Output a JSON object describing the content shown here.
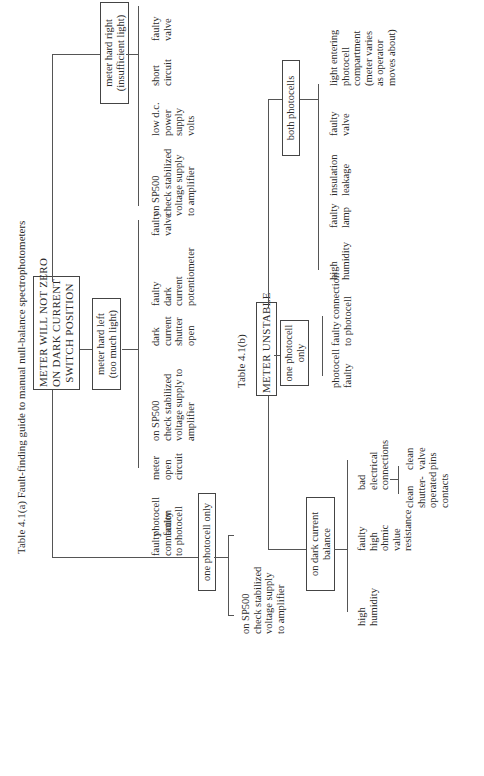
{
  "table_a": {
    "caption": "Table 4.1(a) Fault-finding guide to manual null-balance spectrophotometers",
    "root": "METER WILL NOT ZERO\nON DARK CURRENT\nSWITCH POSITION",
    "branches": [
      {
        "label": "one photocell only",
        "causes": [
          "on SP500\ncheck stabilized\nvoltage supply\nto amplifier",
          "faulty\nconnection\nto photocell",
          "photocell\nfaulty"
        ]
      },
      {
        "label": "meter hard left\n(too much light)",
        "causes": [
          "meter\nopen\ncircuit",
          "on SP500\ncheck stabilized\nvoltage supply to\namplifier",
          "dark\ncurrent\nshutter\nopen",
          "faulty\ndark\ncurrent\npotentiometer",
          "faulty\nvalve"
        ]
      },
      {
        "label": "meter hard right\n(insufficient light)",
        "causes": [
          "on SP500\ncheck stabilized\nvoltage supply\nto amplifier",
          "low d.c.\npower\nsupply\nvolts",
          "short\ncircuit",
          "faulty\nvalve"
        ]
      }
    ]
  },
  "table_b": {
    "caption": "Table 4.1(b)",
    "root": "METER UNSTABLE",
    "branches": [
      {
        "label": "on dark current\nbalance",
        "causes": [
          "high\nhumidity",
          "faulty\nhigh\nohmic\nvalue\nresistance",
          "bad\nelectrical\nconnections"
        ],
        "sub_causes": [
          "clean\nshutter-\noperated\ncontacts",
          "clean\nvalve\npins"
        ]
      },
      {
        "label": "one photocell\nonly",
        "causes": [
          "photocell\nfaulty",
          "faulty connection\nto photocell"
        ]
      },
      {
        "label": "both photocells",
        "causes": [
          "high\nhumidity",
          "faulty\nlamp",
          "insulation\nleakage",
          "faulty\nvalve",
          "light entering\nphotocell\ncompartment\n(meter varies\nas operator\nmoves about)"
        ]
      }
    ]
  }
}
